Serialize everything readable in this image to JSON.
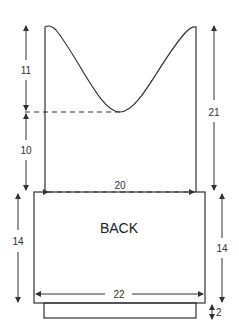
{
  "diagram": {
    "piece_label": "BACK",
    "dimensions": {
      "armhole_upper": "11",
      "armhole_lower": "10",
      "right_total_height": "21",
      "shoulder_width": "20",
      "body_left_height": "14",
      "body_right_height": "14",
      "body_width": "22",
      "rib_height": "2"
    }
  }
}
